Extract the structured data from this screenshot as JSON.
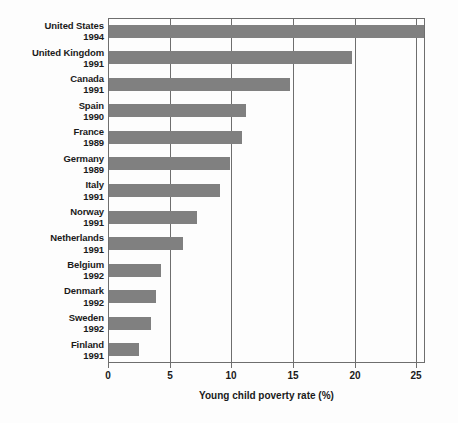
{
  "chart_data": {
    "type": "bar",
    "orientation": "horizontal",
    "title": "",
    "xlabel": "Young child poverty rate (%)",
    "ylabel": "",
    "xlim": [
      0,
      25.7
    ],
    "xticks": [
      0,
      5,
      10,
      15,
      20,
      25
    ],
    "xtick_labels": [
      "0",
      "5",
      "10",
      "15",
      "20",
      "25"
    ],
    "grid": true,
    "legend": null,
    "bar_color": "#808080",
    "axis_color": "#6e6e6e",
    "categories": [
      "United States",
      "United Kingdom",
      "Canada",
      "Spain",
      "France",
      "Germany",
      "Italy",
      "Norway",
      "Netherlands",
      "Belgium",
      "Denmark",
      "Sweden",
      "Finland"
    ],
    "category_years": [
      "1994",
      "1991",
      "1991",
      "1990",
      "1989",
      "1989",
      "1991",
      "1991",
      "1991",
      "1992",
      "1992",
      "1992",
      "1991"
    ],
    "values": [
      25.5,
      19.7,
      14.7,
      11.1,
      10.8,
      9.8,
      9.0,
      7.1,
      6.0,
      4.2,
      3.8,
      3.4,
      2.4
    ]
  }
}
